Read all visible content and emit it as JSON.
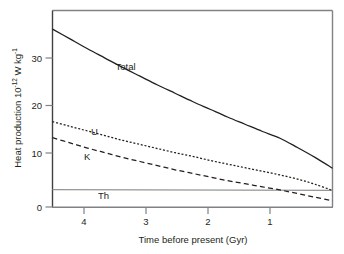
{
  "chart_data": {
    "type": "line",
    "title": "",
    "subtitle": "",
    "xlabel": "Time before present (Gyr)",
    "ylabel_parts": {
      "main": "Heat production 10",
      "exp1": "-12",
      "mid": " W kg",
      "exp2": "-1"
    },
    "ylabel": "Heat production 10-12 W kg-1",
    "xlim": [
      4.5,
      0.5
    ],
    "ylim": [
      0,
      38
    ],
    "x_ticks": [
      4,
      3,
      2,
      1
    ],
    "x_tick_labels": [
      "4",
      "3",
      "2",
      "1"
    ],
    "y_ticks": [
      0,
      10,
      20,
      30
    ],
    "y_tick_labels": [
      "0",
      "10",
      "20",
      "30"
    ],
    "x_axis_inverted": true,
    "grid": false,
    "legend": "inline-labels",
    "series": [
      {
        "name": "Total",
        "label": "Total",
        "style": "solid",
        "color": "#231f20",
        "x": [
          4.5,
          4.25,
          4.0,
          3.75,
          3.5,
          3.25,
          3.0,
          2.75,
          2.5,
          2.25,
          2.0,
          1.75,
          1.5,
          1.25,
          1.0,
          0.75,
          0.5
        ],
        "values": [
          34.4,
          32.5,
          30.6,
          28.8,
          27.0,
          25.3,
          23.6,
          22.0,
          20.4,
          18.9,
          17.4,
          16.0,
          14.6,
          13.3,
          11.5,
          9.6,
          7.5
        ],
        "label_x": 3.6,
        "label_y": 26.5
      },
      {
        "name": "U",
        "label": "U",
        "style": "dotted",
        "color": "#231f20",
        "x": [
          4.5,
          4.25,
          4.0,
          3.75,
          3.5,
          3.25,
          3.0,
          2.75,
          2.5,
          2.25,
          2.0,
          1.75,
          1.5,
          1.25,
          1.0,
          0.75,
          0.5
        ],
        "values": [
          16.5,
          15.6,
          14.7,
          13.8,
          12.9,
          12.1,
          11.3,
          10.5,
          9.8,
          9.0,
          8.3,
          7.6,
          6.9,
          6.2,
          5.4,
          4.4,
          3.2
        ],
        "label_x": 3.95,
        "label_y": 13.9
      },
      {
        "name": "K",
        "label": "K",
        "style": "dashed",
        "color": "#231f20",
        "x": [
          4.5,
          4.25,
          4.0,
          3.75,
          3.5,
          3.25,
          3.0,
          2.75,
          2.5,
          2.25,
          2.0,
          1.75,
          1.5,
          1.25,
          1.0,
          0.75,
          0.5
        ],
        "values": [
          13.4,
          12.4,
          11.4,
          10.5,
          9.6,
          8.8,
          8.0,
          7.2,
          6.5,
          5.8,
          5.1,
          4.5,
          3.9,
          3.3,
          2.6,
          1.9,
          1.2
        ],
        "label_x": 4.05,
        "label_y": 9.0
      },
      {
        "name": "Th",
        "label": "Th",
        "style": "solid-thin-gray",
        "color": "#939598",
        "x": [
          4.5,
          0.5
        ],
        "values": [
          3.35,
          3.2
        ],
        "label_x": 3.85,
        "label_y": 1.6
      }
    ]
  },
  "axes": {
    "frame_color": "#808285",
    "tick_color": "#808285",
    "plot_bg": "#ffffff"
  }
}
